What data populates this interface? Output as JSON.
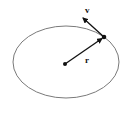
{
  "diagram": {
    "type": "orbit",
    "ellipse": {
      "cx": 66,
      "cy": 62,
      "rx": 53,
      "ry": 36,
      "stroke": "#7a7a7a"
    },
    "center": {
      "x": 65,
      "y": 64
    },
    "body": {
      "x": 104,
      "y": 37
    },
    "vectors": {
      "r": {
        "label": "r",
        "from": [
          65,
          64
        ],
        "to": [
          104,
          37
        ]
      },
      "v": {
        "label": "v",
        "from": [
          104,
          37
        ],
        "to": [
          82,
          17
        ]
      }
    },
    "labels": {
      "r": "r",
      "v": "v"
    },
    "colors": {
      "vector": "#111111",
      "ellipse": "#7a7a7a",
      "background": "#ffffff"
    }
  }
}
